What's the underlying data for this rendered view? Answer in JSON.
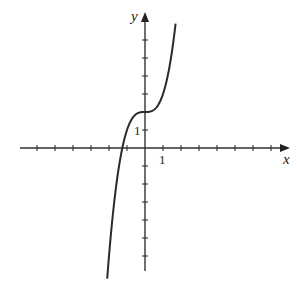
{
  "chart_data": {
    "type": "line",
    "title": "",
    "xlabel": "x",
    "ylabel": "y",
    "function": "y = x^3 + 2",
    "x_tick_label": "1",
    "y_tick_label": "1",
    "xlim": [
      -6,
      7
    ],
    "ylim": [
      -7,
      7
    ],
    "grid": false,
    "legend": null,
    "series": [
      {
        "name": "curve",
        "x": [
          -2.1,
          -1.8,
          -1.5,
          -1.26,
          -1.0,
          -0.5,
          0,
          0.5,
          1.0,
          1.3,
          1.5,
          1.7
        ],
        "y": [
          -7.26,
          -3.83,
          -1.38,
          0.0,
          1.0,
          1.88,
          2.0,
          2.13,
          3.0,
          4.2,
          5.38,
          6.91
        ]
      }
    ]
  }
}
